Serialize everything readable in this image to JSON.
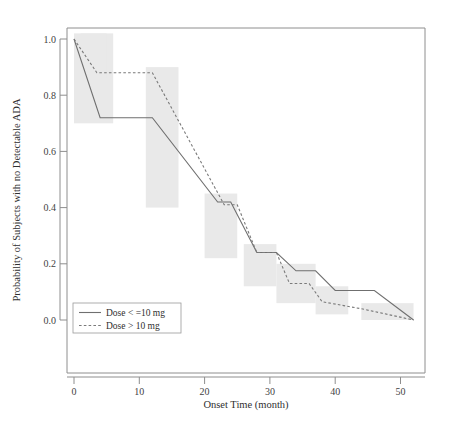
{
  "chart_data": {
    "type": "line",
    "title": "",
    "subtitle": "",
    "xlabel": "Onset Time (month)",
    "ylabel": "Probability of Subjects with no Detectable ADA",
    "xlim": [
      -1,
      54
    ],
    "ylim": [
      0.0,
      1.04
    ],
    "xticks": [
      0,
      10,
      20,
      30,
      40,
      50
    ],
    "xticklabels": [
      "0",
      "10",
      "20",
      "30",
      "40",
      "50"
    ],
    "yticks": [
      0.0,
      0.2,
      0.4,
      0.6,
      0.8,
      1.0
    ],
    "yticklabels": [
      "0.0",
      "0.2",
      "0.4",
      "0.6",
      "0.8",
      "1.0"
    ],
    "grid": false,
    "legend_position": "lower-left",
    "style": "kaplan-meier step/line survival curves with shaded confidence bands",
    "series": [
      {
        "name": "Dose < =10 mg",
        "linestyle": "solid",
        "color": "#6f6f6f",
        "x": [
          0,
          4,
          12,
          22,
          24,
          28,
          31,
          34,
          37,
          40,
          46,
          52
        ],
        "y": [
          1.0,
          0.72,
          0.72,
          0.42,
          0.42,
          0.24,
          0.24,
          0.175,
          0.175,
          0.105,
          0.105,
          0.0
        ]
      },
      {
        "name": "Dose > 10 mg",
        "linestyle": "dashed",
        "color": "#7a7a7a",
        "x": [
          0,
          3.5,
          12,
          23,
          25,
          28,
          31,
          33,
          36,
          38,
          44,
          52
        ],
        "y": [
          1.0,
          0.88,
          0.88,
          0.41,
          0.41,
          0.24,
          0.24,
          0.13,
          0.13,
          0.065,
          0.04,
          0.0
        ]
      }
    ],
    "confidence_bands": [
      {
        "x0": 0,
        "x1": 6,
        "y0": 0.7,
        "y1": 1.02
      },
      {
        "x0": 1,
        "x1": 5,
        "y0": 0.86,
        "y1": 1.02
      },
      {
        "x0": 11,
        "x1": 16,
        "y0": 0.4,
        "y1": 0.9
      },
      {
        "x0": 20,
        "x1": 25,
        "y0": 0.22,
        "y1": 0.45
      },
      {
        "x0": 26,
        "x1": 31,
        "y0": 0.12,
        "y1": 0.27
      },
      {
        "x0": 31,
        "x1": 37,
        "y0": 0.06,
        "y1": 0.2
      },
      {
        "x0": 37,
        "x1": 42,
        "y0": 0.02,
        "y1": 0.12
      },
      {
        "x0": 44,
        "x1": 52,
        "y0": 0.0,
        "y1": 0.06
      }
    ],
    "legend": {
      "entries": [
        {
          "label": "Dose < =10 mg",
          "style": "solid"
        },
        {
          "label": "Dose > 10 mg",
          "style": "dashed"
        }
      ]
    }
  }
}
